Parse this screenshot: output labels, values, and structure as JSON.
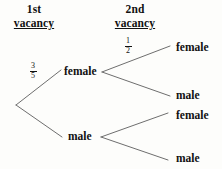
{
  "diagram": {
    "type": "probability-tree",
    "background_color": "#fdfdfb",
    "line_color": "#6e6e6e",
    "text_color": "#111111",
    "headers": [
      {
        "line1": "1st",
        "line2": "vacancy"
      },
      {
        "line1": "2nd",
        "line2": "vacancy"
      }
    ],
    "nodes": {
      "stage1": [
        {
          "label": "female"
        },
        {
          "label": "male"
        }
      ],
      "stage2": [
        {
          "label": "female"
        },
        {
          "label": "male"
        },
        {
          "label": "female"
        },
        {
          "label": "male"
        }
      ]
    },
    "probabilities": [
      {
        "numerator": "3",
        "denominator": "5",
        "branch": "root-to-female"
      },
      {
        "numerator": "1",
        "denominator": "2",
        "branch": "female-to-female"
      }
    ]
  }
}
